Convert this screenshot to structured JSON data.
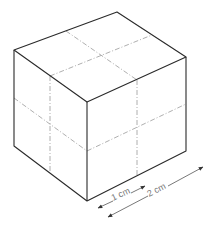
{
  "figure": {
    "type": "isometric-cube",
    "vertices": {
      "top_back": [
        117,
        12
      ],
      "top_left": [
        14,
        50
      ],
      "top_right": [
        186,
        57
      ],
      "front_top": [
        87,
        102
      ],
      "bottom_left": [
        14,
        146
      ],
      "front_bottom": [
        87,
        201
      ],
      "bottom_right": [
        186,
        151
      ]
    },
    "colors": {
      "edge": "#2a2a2a",
      "gridline": "#9a9a9a",
      "dimension": "#555555",
      "label": "#777777"
    }
  },
  "dimensions": [
    {
      "label": "1 cm",
      "from": [
        98,
        208
      ],
      "to": [
        145,
        186
      ]
    },
    {
      "label": "2 cm",
      "from": [
        108,
        217
      ],
      "to": [
        203,
        167
      ]
    }
  ]
}
